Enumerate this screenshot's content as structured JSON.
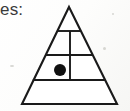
{
  "page": {
    "width": 130,
    "height": 111,
    "background_color": "#fbfbfa",
    "caption_fragment": "es:",
    "caption_color": "#3a3a3a"
  },
  "figure": {
    "name": "pyramid-diagram",
    "stroke_color": "#1a1a1a",
    "fill_color": "#ffffff",
    "dot_color": "#111111",
    "apex": {
      "x": 69,
      "y": 7
    },
    "base_left": {
      "x": 22,
      "y": 104
    },
    "base_right": {
      "x": 117,
      "y": 104
    },
    "band_divider_y": [
      31,
      55,
      80
    ],
    "vertical_divider_x": 70,
    "vertical_divider_top_y": 31,
    "vertical_divider_bottom_y": 80,
    "bands": [
      {
        "index": 1,
        "label": "apex-band",
        "cells": 1,
        "dot": false
      },
      {
        "index": 2,
        "label": "upper-middle-band",
        "cells": 2,
        "dot": false
      },
      {
        "index": 3,
        "label": "lower-middle-band",
        "cells": 2,
        "dot": true
      },
      {
        "index": 4,
        "label": "base-band",
        "cells": 1,
        "dot": false
      }
    ],
    "marker": {
      "name": "filled-dot",
      "cx": 60,
      "cy": 70,
      "r": 6,
      "band": 3,
      "cell": "left"
    }
  },
  "artifacts": {
    "specks": [
      {
        "x": 10,
        "y": 65,
        "w": 4,
        "h": 2
      },
      {
        "x": 103,
        "y": 47,
        "w": 3,
        "h": 3
      },
      {
        "x": 112,
        "y": 13,
        "w": 2,
        "h": 2
      }
    ]
  }
}
